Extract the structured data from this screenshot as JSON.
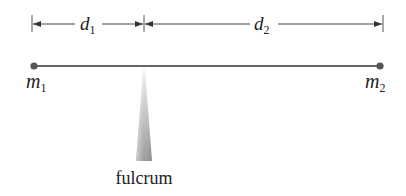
{
  "diagram": {
    "type": "lever",
    "dimensions": [
      {
        "id": "d1",
        "symbol": "d",
        "subscript": "1",
        "from_x": 32,
        "to_x": 144
      },
      {
        "id": "d2",
        "symbol": "d",
        "subscript": "2",
        "from_x": 144,
        "to_x": 383
      }
    ],
    "masses": [
      {
        "id": "m1",
        "symbol": "m",
        "subscript": "1",
        "x": 34
      },
      {
        "id": "m2",
        "symbol": "m",
        "subscript": "2",
        "x": 380
      }
    ],
    "fulcrum": {
      "label": "fulcrum",
      "x": 144
    },
    "colors": {
      "line": "#555555",
      "dot": "#555555",
      "text": "#222222",
      "fulcrum_light": "#e8e8e8",
      "fulcrum_dark": "#9a9a9a"
    }
  }
}
